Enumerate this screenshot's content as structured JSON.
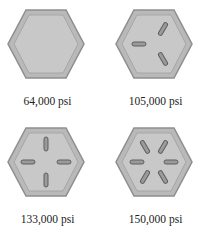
{
  "colors": {
    "hex_fill": "#b9b9b9",
    "hex_inner": "#c8c8c8",
    "hex_edge": "#8e8e8e",
    "mark_fill": "#9a9a9a",
    "mark_edge": "#5f5f5f"
  },
  "bolts": [
    {
      "label": "64,000 psi",
      "marks": 0
    },
    {
      "label": "105,000 psi",
      "marks": 3
    },
    {
      "label": "133,000 psi",
      "marks": 4
    },
    {
      "label": "150,000 psi",
      "marks": 6
    }
  ]
}
